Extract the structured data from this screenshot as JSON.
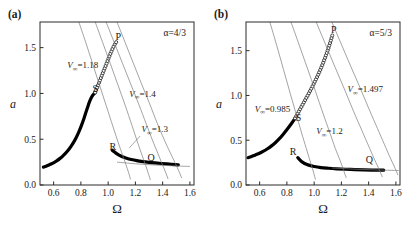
{
  "figure": {
    "panels": [
      {
        "tag": "(a)",
        "alpha_label": "α=4/3",
        "xlabel": "Ω",
        "ylabel": "a",
        "xticks": [
          "0.6",
          "0.8",
          "1.0",
          "1.2",
          "1.4",
          "1.6"
        ],
        "yticks": [
          "0.0",
          "0.5",
          "1.0",
          "1.5"
        ],
        "xlim": [
          0.5,
          1.63
        ],
        "ylim": [
          0.0,
          1.78
        ],
        "point_labels": [
          {
            "name": "P",
            "text": "P",
            "x": 1.075,
            "y": 1.585
          },
          {
            "name": "S",
            "text": "S",
            "x": 0.905,
            "y": 1.015
          },
          {
            "name": "R",
            "text": "R",
            "x": 1.035,
            "y": 0.385
          },
          {
            "name": "Q",
            "text": "Q",
            "x": 1.315,
            "y": 0.265
          }
        ],
        "vinf_labels": [
          {
            "text": "=1.18",
            "x": 0.7,
            "y": 1.275,
            "leader": null
          },
          {
            "text": "=1.4",
            "x": 1.155,
            "y": 0.965,
            "leader": null
          },
          {
            "text": "=1.3",
            "x": 1.245,
            "y": 0.575,
            "leader": {
              "x1": 1.235,
              "y1": 0.535,
              "x2": 1.155,
              "y2": 0.405
            }
          }
        ]
      },
      {
        "tag": "(b)",
        "alpha_label": "α=5/3",
        "xlabel": "Ω",
        "ylabel": "a",
        "xticks": [
          "0.6",
          "0.8",
          "1.0",
          "1.2",
          "1.4",
          "1.6"
        ],
        "yticks": [
          "0.0",
          "0.5",
          "1.0",
          "1.5"
        ],
        "xlim": [
          0.5,
          1.63
        ],
        "ylim": [
          0.0,
          1.82
        ],
        "point_labels": [
          {
            "name": "P",
            "text": "P",
            "x": 1.145,
            "y": 1.7
          },
          {
            "name": "S",
            "text": "S",
            "x": 0.885,
            "y": 0.715
          },
          {
            "name": "R",
            "text": "R",
            "x": 0.845,
            "y": 0.335
          },
          {
            "name": "Q",
            "text": "Q",
            "x": 1.405,
            "y": 0.245
          }
        ],
        "vinf_labels": [
          {
            "text": "=0.985",
            "x": 0.565,
            "y": 0.815,
            "leader": null
          },
          {
            "text": "=1.497",
            "x": 1.245,
            "y": 1.035,
            "leader": null
          },
          {
            "text": "=1.2",
            "x": 1.015,
            "y": 0.565,
            "leader": null
          }
        ]
      }
    ],
    "vinf_symbol": "V",
    "vinf_subscript": "∞",
    "colors": {
      "frame": "#2b2b2b",
      "family_curve": "#7b7b7b",
      "solid_branch": "#000000",
      "open_marker_fill": "#ffffff",
      "text": "#1a1a1a",
      "background": "#ffffff"
    }
  },
  "chart_data": [
    {
      "type": "line",
      "panel": "(a)",
      "title": "",
      "xlabel": "Ω",
      "ylabel": "a",
      "xlim": [
        0.5,
        1.63
      ],
      "ylim": [
        0.0,
        1.78
      ],
      "xticks": [
        0.6,
        0.8,
        1.0,
        1.2,
        1.4,
        1.6
      ],
      "yticks": [
        0.0,
        0.5,
        1.0,
        1.5
      ],
      "grid": false,
      "legend": "none",
      "annotations": [
        "α=4/3",
        "V∞=1.18",
        "V∞=1.4",
        "V∞=1.3",
        "P",
        "S",
        "R",
        "Q"
      ],
      "series": [
        {
          "name": "response-branch-lower-stable",
          "style": "solid-thick",
          "x": [
            0.525,
            0.545,
            0.565,
            0.585,
            0.605,
            0.625,
            0.645,
            0.665,
            0.685,
            0.705,
            0.725,
            0.745,
            0.765,
            0.785,
            0.805,
            0.825,
            0.845,
            0.865,
            0.885,
            0.905
          ],
          "y": [
            0.195,
            0.205,
            0.218,
            0.232,
            0.248,
            0.266,
            0.288,
            0.313,
            0.342,
            0.376,
            0.416,
            0.462,
            0.516,
            0.58,
            0.654,
            0.738,
            0.83,
            0.915,
            0.975,
            1.01
          ]
        },
        {
          "name": "response-branch-unstable-open",
          "style": "open-circles",
          "x": [
            0.905,
            0.915,
            0.925,
            0.935,
            0.945,
            0.955,
            0.965,
            0.975,
            0.985,
            0.995,
            1.005,
            1.015,
            1.025,
            1.035,
            1.045,
            1.055,
            1.065
          ],
          "y": [
            1.01,
            1.048,
            1.086,
            1.124,
            1.162,
            1.2,
            1.238,
            1.276,
            1.314,
            1.352,
            1.39,
            1.428,
            1.462,
            1.496,
            1.526,
            1.552,
            1.572
          ]
        },
        {
          "name": "response-branch-upper-stable",
          "style": "solid-thick",
          "x": [
            1.03,
            1.045,
            1.06,
            1.08,
            1.105,
            1.135,
            1.17,
            1.21,
            1.255,
            1.3,
            1.345,
            1.39,
            1.43,
            1.465,
            1.495,
            1.515
          ],
          "y": [
            0.38,
            0.362,
            0.345,
            0.326,
            0.308,
            0.292,
            0.278,
            0.266,
            0.256,
            0.248,
            0.241,
            0.235,
            0.23,
            0.226,
            0.222,
            0.22
          ]
        },
        {
          "name": "vinf-curve-1.18",
          "style": "thin-gray",
          "x": [
            0.785,
            0.835,
            0.885,
            0.935,
            0.985,
            1.035,
            1.075,
            1.105,
            1.13,
            1.15,
            1.165
          ],
          "y": [
            1.78,
            1.56,
            1.33,
            1.1,
            0.87,
            0.64,
            0.46,
            0.33,
            0.225,
            0.135,
            0.06
          ]
        },
        {
          "name": "vinf-curve-1.3",
          "style": "thin-gray",
          "x": [
            0.905,
            0.96,
            1.015,
            1.07,
            1.125,
            1.175,
            1.215,
            1.25,
            1.275,
            1.295,
            1.31
          ],
          "y": [
            1.78,
            1.555,
            1.33,
            1.1,
            0.87,
            0.65,
            0.47,
            0.32,
            0.215,
            0.125,
            0.055
          ]
        },
        {
          "name": "vinf-curve-1.4",
          "style": "thin-gray",
          "x": [
            0.985,
            1.045,
            1.105,
            1.165,
            1.225,
            1.28,
            1.325,
            1.365,
            1.395,
            1.42,
            1.44
          ],
          "y": [
            1.78,
            1.555,
            1.33,
            1.105,
            0.88,
            0.665,
            0.49,
            0.345,
            0.235,
            0.145,
            0.065
          ]
        },
        {
          "name": "vinf-curve-rightmost",
          "style": "thin-gray",
          "x": [
            1.065,
            1.125,
            1.185,
            1.245,
            1.305,
            1.36,
            1.41,
            1.455,
            1.49,
            1.518,
            1.54
          ],
          "y": [
            1.78,
            1.555,
            1.33,
            1.105,
            0.885,
            0.675,
            0.5,
            0.355,
            0.245,
            0.155,
            0.075
          ]
        },
        {
          "name": "asymptote-tail",
          "style": "thin-gray",
          "x": [
            1.065,
            1.2,
            1.35,
            1.5,
            1.6
          ],
          "y": [
            0.25,
            0.232,
            0.218,
            0.208,
            0.203
          ]
        }
      ]
    },
    {
      "type": "line",
      "panel": "(b)",
      "title": "",
      "xlabel": "Ω",
      "ylabel": "a",
      "xlim": [
        0.5,
        1.63
      ],
      "ylim": [
        0.0,
        1.82
      ],
      "xticks": [
        0.6,
        0.8,
        1.0,
        1.2,
        1.4,
        1.6
      ],
      "yticks": [
        0.0,
        0.5,
        1.0,
        1.5
      ],
      "grid": false,
      "legend": "none",
      "annotations": [
        "α=5/3",
        "V∞=0.985",
        "V∞=1.497",
        "V∞=1.2",
        "P",
        "S",
        "R",
        "Q"
      ],
      "series": [
        {
          "name": "response-branch-lower-stable",
          "style": "solid-thick",
          "x": [
            0.515,
            0.54,
            0.565,
            0.595,
            0.625,
            0.655,
            0.685,
            0.715,
            0.745,
            0.775,
            0.805,
            0.835,
            0.86
          ],
          "y": [
            0.305,
            0.318,
            0.333,
            0.352,
            0.375,
            0.402,
            0.434,
            0.472,
            0.517,
            0.57,
            0.628,
            0.69,
            0.745
          ]
        },
        {
          "name": "response-branch-unstable-open",
          "style": "open-circles",
          "x": [
            0.86,
            0.88,
            0.9,
            0.92,
            0.94,
            0.96,
            0.98,
            1.0,
            1.02,
            1.04,
            1.06,
            1.08,
            1.1,
            1.12,
            1.135
          ],
          "y": [
            0.745,
            0.8,
            0.855,
            0.91,
            0.965,
            1.02,
            1.078,
            1.138,
            1.2,
            1.268,
            1.34,
            1.42,
            1.505,
            1.6,
            1.68
          ]
        },
        {
          "name": "response-branch-upper-stable",
          "style": "solid-thick",
          "x": [
            0.88,
            0.905,
            0.93,
            0.96,
            1.0,
            1.05,
            1.105,
            1.165,
            1.23,
            1.3,
            1.365,
            1.425,
            1.475,
            1.51
          ],
          "y": [
            0.305,
            0.265,
            0.24,
            0.222,
            0.206,
            0.194,
            0.187,
            0.181,
            0.176,
            0.172,
            0.169,
            0.167,
            0.166,
            0.165
          ]
        },
        {
          "name": "vinf-curve-0.985",
          "style": "thin-gray",
          "x": [
            0.675,
            0.725,
            0.775,
            0.825,
            0.875,
            0.915,
            0.95,
            0.975,
            0.995,
            1.01
          ],
          "y": [
            1.82,
            1.56,
            1.29,
            1.02,
            0.755,
            0.545,
            0.37,
            0.245,
            0.145,
            0.06
          ]
        },
        {
          "name": "vinf-curve-1.2",
          "style": "thin-gray",
          "x": [
            0.83,
            0.89,
            0.95,
            1.01,
            1.065,
            1.115,
            1.155,
            1.19,
            1.215,
            1.235
          ],
          "y": [
            1.82,
            1.565,
            1.305,
            1.045,
            0.8,
            0.585,
            0.41,
            0.275,
            0.17,
            0.08
          ]
        },
        {
          "name": "vinf-curve-1.497",
          "style": "thin-gray",
          "x": [
            1.015,
            1.085,
            1.155,
            1.225,
            1.29,
            1.35,
            1.4,
            1.44,
            1.475,
            1.5
          ],
          "y": [
            1.82,
            1.565,
            1.31,
            1.06,
            0.82,
            0.61,
            0.435,
            0.295,
            0.18,
            0.09
          ]
        },
        {
          "name": "vinf-curve-rightmost",
          "style": "thin-gray",
          "x": [
            1.13,
            1.2,
            1.27,
            1.34,
            1.405,
            1.465,
            1.515,
            1.555,
            1.59,
            1.615
          ],
          "y": [
            1.82,
            1.57,
            1.32,
            1.075,
            0.84,
            0.63,
            0.455,
            0.315,
            0.2,
            0.11
          ]
        },
        {
          "name": "asymptote-tail",
          "style": "thin-gray",
          "x": [
            1.13,
            1.28,
            1.42,
            1.54,
            1.62
          ],
          "y": [
            0.19,
            0.178,
            0.17,
            0.165,
            0.162
          ]
        }
      ]
    }
  ]
}
